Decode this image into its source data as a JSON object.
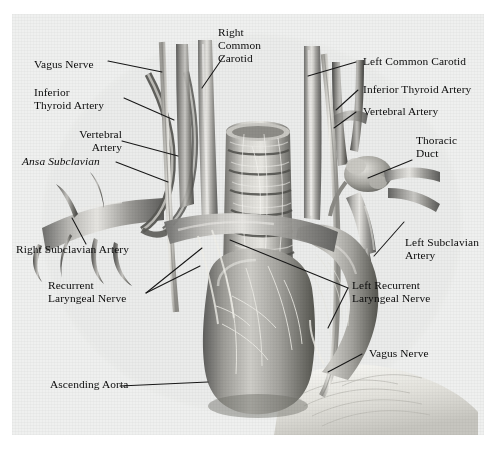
{
  "figure": {
    "background_color": "#eff0ef",
    "page_color": "#ffffff",
    "ink_color": "#0b0b0b"
  },
  "labels": [
    {
      "id": "right-common-carotid",
      "text": "Right\nCommon\nCarotid",
      "align": "left",
      "italic": false
    },
    {
      "id": "vagus-nerve-left",
      "text": "Vagus Nerve",
      "align": "left",
      "italic": false
    },
    {
      "id": "inferior-thyroid-artery-l",
      "text": "Inferior\nThyroid Artery",
      "align": "left",
      "italic": false
    },
    {
      "id": "vertebral-artery-left",
      "text": "Vertebral\nArtery",
      "align": "right",
      "italic": false
    },
    {
      "id": "ansa-subclavian",
      "text": "Ansa Subclavian",
      "align": "left",
      "italic": true
    },
    {
      "id": "right-subclavian-artery",
      "text": "Right Subclavian Artery",
      "align": "left",
      "italic": false
    },
    {
      "id": "recurrent-laryngeal-nerve",
      "text": "Recurrent\nLaryngeal Nerve",
      "align": "left",
      "italic": false
    },
    {
      "id": "ascending-aorta",
      "text": "Ascending Aorta",
      "align": "left",
      "italic": false
    },
    {
      "id": "left-common-carotid",
      "text": "Left Common Carotid",
      "align": "left",
      "italic": false
    },
    {
      "id": "inferior-thyroid-artery-r",
      "text": "Inferior Thyroid Artery",
      "align": "left",
      "italic": false
    },
    {
      "id": "vertebral-artery-right",
      "text": "Vertebral Artery",
      "align": "left",
      "italic": false
    },
    {
      "id": "thoracic-duct",
      "text": "Thoracic\nDuct",
      "align": "left",
      "italic": false
    },
    {
      "id": "left-subclavian-artery",
      "text": "Left Subclavian\nArtery",
      "align": "left",
      "italic": false
    },
    {
      "id": "left-recurrent-laryngeal",
      "text": "Left Recurrent\nLaryngeal Nerve",
      "align": "left",
      "italic": false
    },
    {
      "id": "vagus-nerve-right",
      "text": "Vagus Nerve",
      "align": "left",
      "italic": false
    }
  ],
  "structures": [
    {
      "id": "trachea",
      "name": "Trachea with cartilage rings"
    },
    {
      "id": "ascending-aorta-vessel",
      "name": "Ascending aorta"
    },
    {
      "id": "aortic-arch",
      "name": "Aortic arch"
    },
    {
      "id": "brachiocephalic-trunk",
      "name": "Brachiocephalic trunk"
    },
    {
      "id": "right-common-carotid-vessel",
      "name": "Right common carotid artery"
    },
    {
      "id": "left-common-carotid-vessel",
      "name": "Left common carotid artery"
    },
    {
      "id": "right-subclavian-vessel",
      "name": "Right subclavian artery"
    },
    {
      "id": "left-subclavian-vessel",
      "name": "Left subclavian artery"
    },
    {
      "id": "vagus-nerve-trunk-right",
      "name": "Right vagus nerve"
    },
    {
      "id": "vagus-nerve-trunk-left",
      "name": "Left vagus nerve"
    },
    {
      "id": "ansa-subclavian-loop",
      "name": "Ansa subclavia loop"
    },
    {
      "id": "thoracic-duct-vessel",
      "name": "Thoracic duct"
    },
    {
      "id": "pericardial-fat",
      "name": "Pericardial fat / pleura"
    }
  ]
}
